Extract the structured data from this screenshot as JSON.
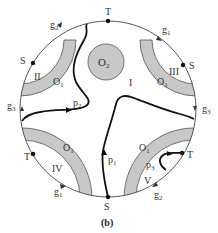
{
  "figure": {
    "caption": "(b)",
    "colors": {
      "background": "#ffffff",
      "boundary": "#444444",
      "obstacle_fill": "#c8c8c8",
      "obstacle_stroke": "#555555",
      "path": "#111111",
      "point": "#111111",
      "label": "#333333"
    },
    "boundary_circle": {
      "cx": 108,
      "cy": 109,
      "r": 88
    },
    "obstacle_O2": {
      "label": "O",
      "sub": "2",
      "cx": 106,
      "cy": 62,
      "r": 18
    },
    "obstacle_O1_label": {
      "main": "O",
      "sub": "1"
    },
    "regions": [
      "I",
      "II",
      "III",
      "IV",
      "V"
    ],
    "boundary_points": [
      {
        "label": "T",
        "pos": "top"
      },
      {
        "label": "S",
        "pos": "upper-left"
      },
      {
        "label": "S",
        "pos": "upper-right"
      },
      {
        "label": "T",
        "pos": "lower-left"
      },
      {
        "label": "T",
        "pos": "lower-right"
      },
      {
        "label": "S",
        "pos": "bottom"
      }
    ],
    "boundary_arcs": [
      {
        "label": "g",
        "sub": "2",
        "pos": "upper-left"
      },
      {
        "label": "g",
        "sub": "1",
        "pos": "upper-right"
      },
      {
        "label": "g",
        "sub": "3",
        "pos": "left"
      },
      {
        "label": "g",
        "sub": "3",
        "pos": "right"
      },
      {
        "label": "g",
        "sub": "1",
        "pos": "lower-left"
      },
      {
        "label": "g",
        "sub": "2",
        "pos": "lower-right"
      }
    ],
    "paths": [
      {
        "label": "p",
        "sub": "1"
      },
      {
        "label": "p",
        "sub": "2"
      },
      {
        "label": "p",
        "sub": "3"
      }
    ]
  }
}
